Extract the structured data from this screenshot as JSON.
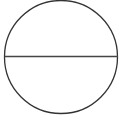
{
  "diagram": {
    "shape": "circle-with-horizontal-diameter",
    "stroke_color": "#333333",
    "background": "#ffffff",
    "circle": {
      "cx": 61,
      "cy": 57,
      "r": 57
    },
    "diameter": {
      "x1": 4,
      "y1": 56.5,
      "x2": 118,
      "y2": 56.5
    }
  }
}
